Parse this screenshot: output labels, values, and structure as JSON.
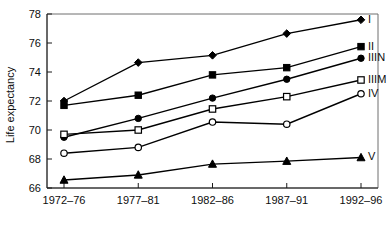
{
  "chart_data": {
    "type": "line",
    "title": "",
    "xlabel": "",
    "ylabel": "Life expectancy",
    "categories": [
      "1972–76",
      "1977–81",
      "1982–86",
      "1987–91",
      "1992–96"
    ],
    "ylim": [
      66,
      78
    ],
    "yticks": [
      66,
      68,
      70,
      72,
      74,
      76,
      78
    ],
    "ytick_labels": [
      "66",
      "68",
      "70",
      "72",
      "74",
      "76",
      "78"
    ],
    "grid": false,
    "legend_position": "right-inline-end-of-line",
    "series": [
      {
        "name": "I",
        "label": "I",
        "marker": "filled-diamond",
        "values": [
          72.0,
          74.65,
          75.15,
          76.65,
          77.6
        ]
      },
      {
        "name": "II",
        "label": "II",
        "marker": "filled-square",
        "values": [
          71.7,
          72.4,
          73.8,
          74.3,
          75.75
        ]
      },
      {
        "name": "IIIN",
        "label": "IIIN",
        "marker": "filled-circle",
        "values": [
          69.5,
          70.8,
          72.2,
          73.5,
          74.95
        ]
      },
      {
        "name": "IIIM",
        "label": "IIIM",
        "marker": "open-square",
        "values": [
          69.7,
          70.0,
          71.45,
          72.3,
          73.45
        ]
      },
      {
        "name": "IV",
        "label": "IV",
        "marker": "open-circle",
        "values": [
          68.4,
          68.8,
          70.55,
          70.4,
          72.5
        ]
      },
      {
        "name": "V",
        "label": "V",
        "marker": "filled-triangle",
        "values": [
          66.55,
          66.9,
          67.65,
          67.85,
          68.1
        ]
      }
    ]
  },
  "figure": {
    "y_axis_title": "Life expectancy"
  }
}
